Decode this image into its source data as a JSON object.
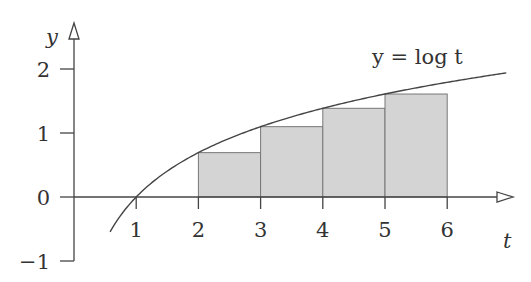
{
  "chart_data": {
    "type": "bar",
    "title": "",
    "xlabel": "t",
    "ylabel": "y",
    "xlim": [
      0,
      7.1
    ],
    "ylim": [
      -1,
      2.4
    ],
    "x_ticks": [
      1,
      2,
      3,
      4,
      5,
      6
    ],
    "x_tick_labels": [
      "1",
      "2",
      "3",
      "4",
      "5",
      "6"
    ],
    "y_ticks": [
      -1,
      0,
      1,
      2
    ],
    "y_tick_labels": [
      "−1",
      "0",
      "1",
      "2"
    ],
    "grid": false,
    "curve": {
      "label": "y = log t",
      "function": "ln",
      "t_range": [
        0.58,
        6.95
      ]
    },
    "bars": [
      {
        "left": 2,
        "right": 3,
        "value": 0.693
      },
      {
        "left": 3,
        "right": 4,
        "value": 1.099
      },
      {
        "left": 4,
        "right": 5,
        "value": 1.386
      },
      {
        "left": 5,
        "right": 6,
        "value": 1.609
      }
    ],
    "colors": {
      "bar_fill": "#d4d4d4",
      "bar_stroke": "#777777",
      "axis": "#444444",
      "curve": "#444444"
    }
  }
}
